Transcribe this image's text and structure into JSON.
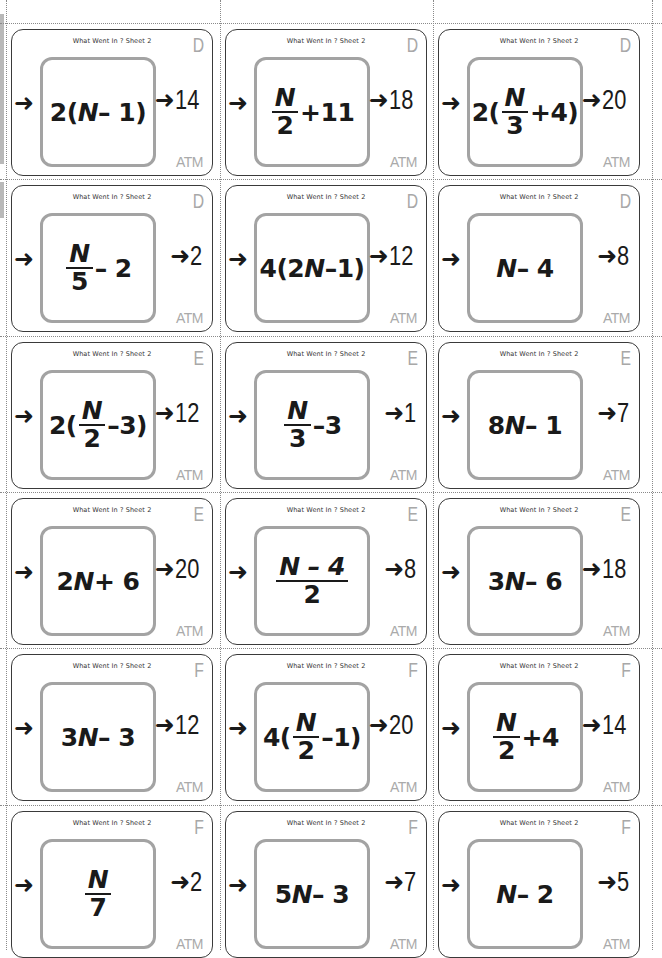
{
  "sheet": {
    "title": "What Went In ? Sheet 2",
    "logo": "ATM",
    "arrow_icon": "➜",
    "colors": {
      "card_border": "#3a3a3a",
      "inner_box": "#a3a3a3",
      "level_letter": "#a8a8a8",
      "logo": "#aaaaaa",
      "cut_line": "#8a8a8a"
    }
  },
  "cards": [
    {
      "level": "D",
      "expr": {
        "type": "text",
        "parts": [
          "2(",
          "N",
          " – 1)"
        ]
      },
      "output": "14"
    },
    {
      "level": "D",
      "expr": {
        "type": "frac_plus",
        "num": "N",
        "den": "2",
        "suffix": "+11"
      },
      "output": "18"
    },
    {
      "level": "D",
      "expr": {
        "type": "wrap_frac",
        "prefix": "2(",
        "num": "N",
        "den": "3",
        "suffix": "+4)"
      },
      "output": "20"
    },
    {
      "level": "D",
      "expr": {
        "type": "frac_plus",
        "num": "N",
        "den": "5",
        "suffix": " – 2"
      },
      "output": "2"
    },
    {
      "level": "D",
      "expr": {
        "type": "text",
        "parts": [
          "4(2",
          "N",
          "–1)"
        ]
      },
      "output": "12"
    },
    {
      "level": "D",
      "expr": {
        "type": "text",
        "parts": [
          "",
          "N",
          " – 4"
        ]
      },
      "output": "8"
    },
    {
      "level": "E",
      "expr": {
        "type": "wrap_frac",
        "prefix": "2(",
        "num": "N",
        "den": "2",
        "suffix": "–3)"
      },
      "output": "12"
    },
    {
      "level": "E",
      "expr": {
        "type": "frac_plus",
        "num": "N",
        "den": "3",
        "suffix": "–3"
      },
      "output": "1"
    },
    {
      "level": "E",
      "expr": {
        "type": "text",
        "parts": [
          "8",
          "N",
          " – 1"
        ]
      },
      "output": "7"
    },
    {
      "level": "E",
      "expr": {
        "type": "text",
        "parts": [
          "2",
          "N",
          " + 6"
        ]
      },
      "output": "20"
    },
    {
      "level": "E",
      "expr": {
        "type": "frac_expr",
        "num": "N – 4",
        "den": "2"
      },
      "output": "8"
    },
    {
      "level": "E",
      "expr": {
        "type": "text",
        "parts": [
          "3",
          "N",
          " – 6"
        ]
      },
      "output": "18"
    },
    {
      "level": "F",
      "expr": {
        "type": "text",
        "parts": [
          "3",
          "N",
          " – 3"
        ]
      },
      "output": "12"
    },
    {
      "level": "F",
      "expr": {
        "type": "wrap_frac",
        "prefix": "4(",
        "num": "N",
        "den": "2",
        "suffix": "–1)"
      },
      "output": "20"
    },
    {
      "level": "F",
      "expr": {
        "type": "frac_plus",
        "num": "N",
        "den": "2",
        "suffix": "+4"
      },
      "output": "14"
    },
    {
      "level": "F",
      "expr": {
        "type": "frac_plus",
        "num": "N",
        "den": "7",
        "suffix": ""
      },
      "output": "2"
    },
    {
      "level": "F",
      "expr": {
        "type": "text",
        "parts": [
          "5",
          "N",
          " – 3"
        ]
      },
      "output": "7"
    },
    {
      "level": "F",
      "expr": {
        "type": "text",
        "parts": [
          "",
          "N",
          " – 2"
        ]
      },
      "output": "5"
    }
  ]
}
